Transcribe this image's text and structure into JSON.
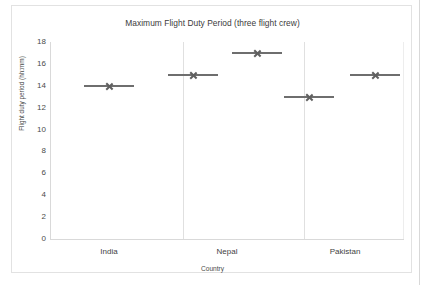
{
  "chart_data": {
    "type": "scatter",
    "title": "Maximum Flight Duty Period (three flight crew)",
    "xlabel": "Country",
    "ylabel": "Flight duty period (hh:mm)",
    "categories": [
      "India",
      "Nepal",
      "Pakistan"
    ],
    "ylim": [
      0,
      18
    ],
    "yticks": [
      0,
      2,
      4,
      6,
      8,
      10,
      12,
      14,
      16,
      18
    ],
    "ytick_labels": [
      "0",
      "2",
      "4",
      "6",
      "8",
      "10",
      "12",
      "14",
      "16",
      "18"
    ],
    "grid": false,
    "legend": "none",
    "marker_style": "x-with-horizontal-line",
    "marker_color": "#6e6e6e",
    "series": [
      {
        "name": "Series 1",
        "values": [
          14,
          15,
          13
        ],
        "points": [
          {
            "category": "India",
            "slot": 1,
            "value": 14
          },
          {
            "category": "Nepal",
            "slot": 1,
            "value": 15
          },
          {
            "category": "Pakistan",
            "slot": 1,
            "value": 13
          }
        ]
      },
      {
        "name": "Series 2",
        "values": [
          null,
          17,
          15
        ],
        "points": [
          {
            "category": "Nepal",
            "slot": 2,
            "value": 17
          },
          {
            "category": "Pakistan",
            "slot": 2,
            "value": 15
          }
        ]
      }
    ],
    "markers": [
      {
        "category": "India",
        "value": 14,
        "cx": 59,
        "half_width": 25
      },
      {
        "category": "Nepal",
        "value": 15,
        "cx": 143,
        "half_width": 25
      },
      {
        "category": "Nepal",
        "value": 17,
        "cx": 207,
        "half_width": 25
      },
      {
        "category": "Pakistan",
        "value": 13,
        "cx": 259,
        "half_width": 25
      },
      {
        "category": "Pakistan",
        "value": 15,
        "cx": 325,
        "half_width": 25
      }
    ]
  },
  "axes": {
    "y_axis_color": "#d9d9d9",
    "x_axis_color": "#d9d9d9",
    "separator_color": "#e0e0e0",
    "category_centers_px": [
      59,
      177,
      295
    ],
    "separators_px": [
      133,
      254
    ]
  }
}
